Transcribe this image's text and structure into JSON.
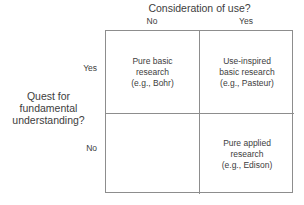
{
  "figure": {
    "type": "2x2-matrix-diagram",
    "colors": {
      "border": "#8d8d8d",
      "text": "#3d3d3d",
      "background": "#ffffff"
    }
  },
  "column_axis": {
    "title": "Consideration of use?",
    "labels": [
      "No",
      "Yes"
    ]
  },
  "row_axis": {
    "title_lines": [
      "Quest for",
      "fundamental",
      "understanding?"
    ],
    "labels": [
      "Yes",
      "No"
    ]
  },
  "cells": {
    "top_left": {
      "lines": [
        "Pure basic",
        "research",
        "(e.g., Bohr)"
      ]
    },
    "top_right": {
      "lines": [
        "Use-inspired",
        "basic research",
        "(e.g., Pasteur)"
      ]
    },
    "bottom_left": {
      "lines": []
    },
    "bottom_right": {
      "lines": [
        "Pure applied",
        "research",
        "(e.g., Edison)"
      ]
    }
  },
  "chart_data": {
    "type": "table",
    "xlabel": "Consideration of use?",
    "ylabel": "Quest for fundamental understanding?",
    "x_categories": [
      "No",
      "Yes"
    ],
    "y_categories": [
      "Yes",
      "No"
    ],
    "grid": true,
    "legend": "none",
    "rows": [
      {
        "y": "Yes",
        "values": [
          "Pure basic research (e.g., Bohr)",
          "Use-inspired basic research (e.g., Pasteur)"
        ]
      },
      {
        "y": "No",
        "values": [
          "",
          "Pure applied research (e.g., Edison)"
        ]
      }
    ]
  }
}
